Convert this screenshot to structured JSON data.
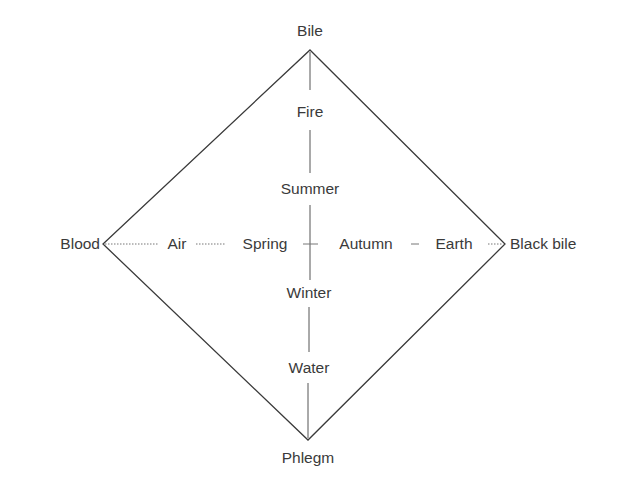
{
  "diagram": {
    "type": "four-humours-diamond",
    "vertices": {
      "top": "Bile",
      "left": "Blood",
      "right": "Black bile",
      "bottom": "Phlegm"
    },
    "vertical_axis": [
      "Fire",
      "Summer",
      "Winter",
      "Water"
    ],
    "horizontal_axis": [
      "Air",
      "Spring",
      "Autumn",
      "Earth"
    ],
    "colors": {
      "line": "#3a3a3a",
      "text": "#3a3a3a",
      "background": "#ffffff"
    }
  }
}
